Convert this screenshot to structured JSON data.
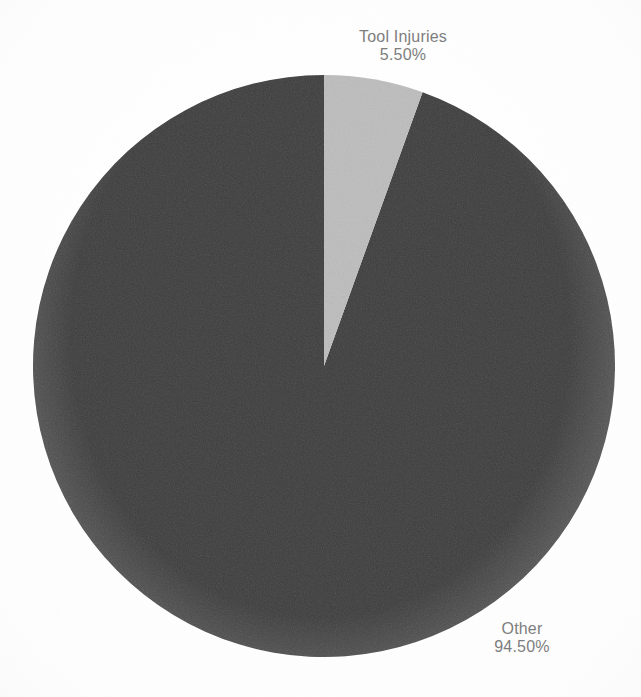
{
  "chart_data": {
    "type": "pie",
    "title": "",
    "subtitle": "",
    "xlabel": "",
    "ylabel": "",
    "grid": false,
    "legend": "none",
    "label_position": "outside",
    "start_angle_deg": 0,
    "direction": "clockwise",
    "categories": [
      "Tool Injuries",
      "Other"
    ],
    "values": [
      5.5,
      94.5
    ],
    "value_unit": "%",
    "slices": [
      {
        "label": "Tool Injuries",
        "value": 5.5,
        "value_text": "5.50%",
        "color": "#bdbdbd",
        "start_angle_deg": 0,
        "end_angle_deg": 19.8
      },
      {
        "label": "Other",
        "value": 94.5,
        "value_text": "94.50%",
        "color": "#3a3a3a",
        "start_angle_deg": 19.8,
        "end_angle_deg": 360
      }
    ]
  },
  "labels": {
    "tool_injuries": {
      "name": "Tool Injuries",
      "value": "5.50%"
    },
    "other": {
      "name": "Other",
      "value": "94.50%"
    }
  },
  "colors": {
    "background": "#ffffff",
    "slice_tool_injuries": "#bdbdbd",
    "slice_other": "#3a3a3a",
    "label_text": "#7d7d7d"
  },
  "geometry": {
    "center_x": 324,
    "center_y": 366,
    "radius": 291
  }
}
